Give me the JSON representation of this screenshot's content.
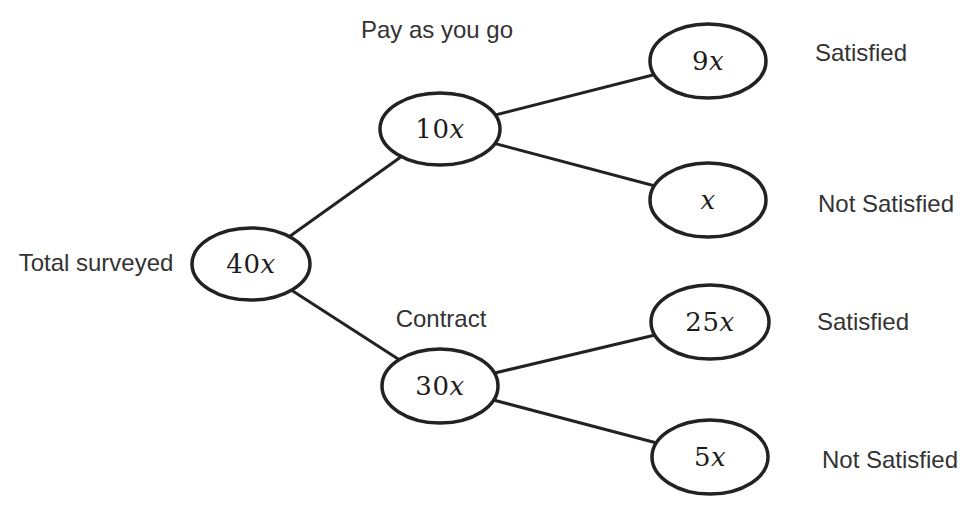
{
  "colors": {
    "stroke": "#222222",
    "node_fill": "#ffffff",
    "label_text": "#333333",
    "node_text": "#1c1c1c",
    "background": "#ffffff"
  },
  "tree": {
    "root": {
      "annotation": "Total surveyed",
      "coefficient": "40",
      "variable": "x"
    },
    "branches": [
      {
        "annotation": "Pay as you go",
        "coefficient": "10",
        "variable": "x",
        "children": [
          {
            "annotation": "Satisfied",
            "coefficient": "9",
            "variable": "x"
          },
          {
            "annotation": "Not Satisfied",
            "coefficient": "",
            "variable": "x"
          }
        ]
      },
      {
        "annotation": "Contract",
        "coefficient": "30",
        "variable": "x",
        "children": [
          {
            "annotation": "Satisfied",
            "coefficient": "25",
            "variable": "x"
          },
          {
            "annotation": "Not Satisfied",
            "coefficient": "5",
            "variable": "x"
          }
        ]
      }
    ]
  }
}
